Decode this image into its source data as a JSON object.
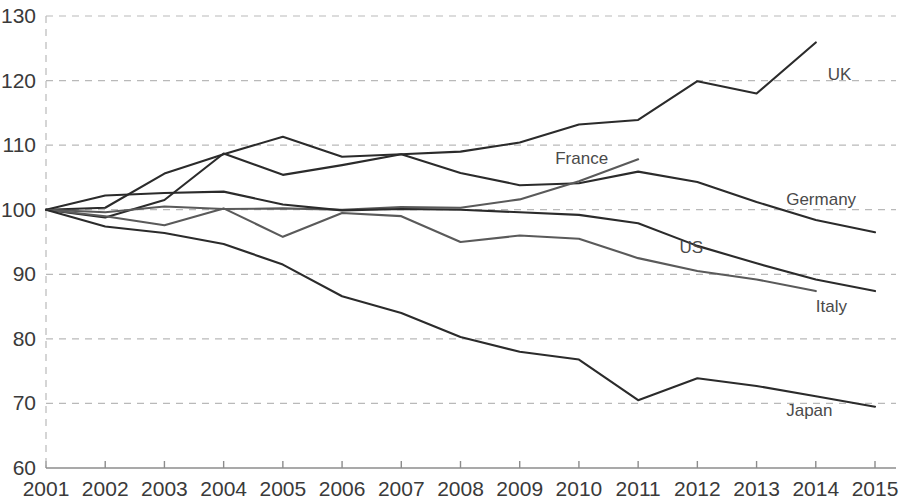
{
  "chart_data": {
    "type": "line",
    "title": "",
    "subtitle": "",
    "xlabel": "",
    "ylabel": "",
    "x": [
      2001,
      2002,
      2003,
      2004,
      2005,
      2006,
      2007,
      2008,
      2009,
      2010,
      2011,
      2012,
      2013,
      2014,
      2015
    ],
    "categories": [
      "2001",
      "2002",
      "2003",
      "2004",
      "2005",
      "2006",
      "2007",
      "2008",
      "2009",
      "2010",
      "2011",
      "2012",
      "2013",
      "2014",
      "2015"
    ],
    "xlim": [
      2001,
      2015
    ],
    "ylim": [
      60,
      130
    ],
    "yticks": [
      60,
      70,
      80,
      90,
      100,
      110,
      120,
      130
    ],
    "ytick_labels": [
      "60",
      "70",
      "80",
      "90",
      "100",
      "110",
      "120",
      "130"
    ],
    "xticks": [
      2001,
      2002,
      2003,
      2004,
      2005,
      2006,
      2007,
      2008,
      2009,
      2010,
      2011,
      2012,
      2013,
      2014,
      2015
    ],
    "grid": "horizontal-dashed",
    "legend_position": "inline-end-of-line",
    "line_color": "#2b2b2b",
    "grid_color": "#b9b9b9",
    "axis_color": "#8c8c8c",
    "series": [
      {
        "name": "UK",
        "label": "UK",
        "color": "#2b2b2b",
        "x": [
          2001,
          2002,
          2003,
          2004,
          2005,
          2006,
          2007,
          2008,
          2009,
          2010,
          2011,
          2012,
          2013,
          2014
        ],
        "values": [
          100.0,
          100.3,
          105.6,
          108.6,
          111.3,
          108.2,
          108.6,
          109.0,
          110.4,
          113.2,
          113.9,
          119.9,
          118.0,
          125.9
        ],
        "label_x": 2014.2,
        "label_y": 120.8
      },
      {
        "name": "Germany",
        "label": "Germany",
        "color": "#2b2b2b",
        "x": [
          2001,
          2002,
          2003,
          2004,
          2005,
          2006,
          2007,
          2008,
          2009,
          2010,
          2011,
          2012,
          2013,
          2014,
          2015
        ],
        "values": [
          100.0,
          98.8,
          101.5,
          108.7,
          105.4,
          106.9,
          108.6,
          105.7,
          103.8,
          104.1,
          105.9,
          104.3,
          101.2,
          98.4,
          96.5
        ],
        "label_x": 2013.5,
        "label_y": 101.5
      },
      {
        "name": "France",
        "label": "France",
        "color": "#5a5a5a",
        "x": [
          2001,
          2002,
          2003,
          2004,
          2005,
          2006,
          2007,
          2008,
          2009,
          2010,
          2011
        ],
        "values": [
          100.0,
          99.6,
          100.5,
          100.1,
          100.2,
          100.0,
          100.4,
          100.3,
          101.6,
          104.4,
          107.8
        ],
        "label_x": 2009.6,
        "label_y": 107.9
      },
      {
        "name": "Italy",
        "label": "Italy",
        "color": "#2b2b2b",
        "x": [
          2001,
          2002,
          2003,
          2004,
          2005,
          2006,
          2007,
          2008,
          2009,
          2010,
          2011,
          2012,
          2013,
          2014,
          2015
        ],
        "values": [
          100.0,
          102.2,
          102.6,
          102.8,
          100.8,
          99.9,
          100.1,
          100.0,
          99.6,
          99.2,
          97.9,
          94.4,
          91.7,
          89.2,
          87.4
        ],
        "label_x": 2014.0,
        "label_y": 85.0
      },
      {
        "name": "US",
        "label": "US",
        "color": "#5a5a5a",
        "x": [
          2001,
          2002,
          2003,
          2004,
          2005,
          2006,
          2007,
          2008,
          2009,
          2010,
          2011,
          2012,
          2013,
          2014
        ],
        "values": [
          100.0,
          99.0,
          97.6,
          100.2,
          95.8,
          99.5,
          99.0,
          95.0,
          96.0,
          95.5,
          92.5,
          90.5,
          89.2,
          87.4
        ],
        "label_x": 2011.7,
        "label_y": 94.0
      },
      {
        "name": "Japan",
        "label": "Japan",
        "color": "#2b2b2b",
        "x": [
          2001,
          2002,
          2003,
          2004,
          2005,
          2006,
          2007,
          2008,
          2009,
          2010,
          2011,
          2012,
          2013,
          2014,
          2015
        ],
        "values": [
          100.0,
          97.4,
          96.4,
          94.7,
          91.5,
          86.6,
          84.0,
          80.3,
          78.0,
          76.8,
          70.5,
          73.9,
          72.7,
          71.1,
          69.5
        ],
        "label_x": 2013.5,
        "label_y": 68.9
      }
    ]
  }
}
